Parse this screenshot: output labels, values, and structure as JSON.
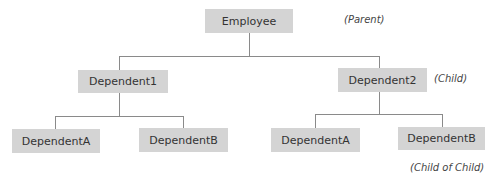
{
  "diagram": {
    "type": "hierarchy-tree",
    "colors": {
      "node_fill": "#d4d4d4",
      "connector": "#8a8a8a",
      "text": "#333333"
    },
    "root": {
      "label": "Employee",
      "annotation": "(Parent)"
    },
    "children": [
      {
        "label": "Dependent1",
        "children": [
          {
            "label": "DependentA"
          },
          {
            "label": "DependentB"
          }
        ]
      },
      {
        "label": "Dependent2",
        "annotation": "(Child)",
        "children": [
          {
            "label": "DependentA"
          },
          {
            "label": "DependentB",
            "annotation": "(Child of Child)"
          }
        ]
      }
    ]
  }
}
